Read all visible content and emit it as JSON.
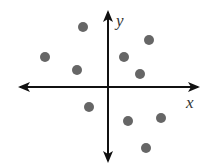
{
  "chart_data": {
    "type": "scatter",
    "title": "",
    "xlabel": "x",
    "ylabel": "y",
    "grid": false,
    "legend": null,
    "ticks": "none",
    "note": "Coordinates in pixel-offset units from origin (x right positive, y up positive); no numeric scale shown.",
    "origin_px": [
      108,
      87
    ],
    "xlim": [
      -90,
      92
    ],
    "ylim": [
      -76,
      77
    ],
    "points": [
      {
        "x": -25,
        "y": 60
      },
      {
        "x": -63,
        "y": 30
      },
      {
        "x": -31,
        "y": 17
      },
      {
        "x": 41,
        "y": 47
      },
      {
        "x": 16,
        "y": 30
      },
      {
        "x": 32,
        "y": 13
      },
      {
        "x": -19,
        "y": -20
      },
      {
        "x": 20,
        "y": -34
      },
      {
        "x": 53,
        "y": -31
      },
      {
        "x": 38,
        "y": -61
      }
    ],
    "point_color": "#666666",
    "axis_color": "#111111"
  },
  "labels": {
    "x_axis": "x",
    "y_axis": "y"
  }
}
